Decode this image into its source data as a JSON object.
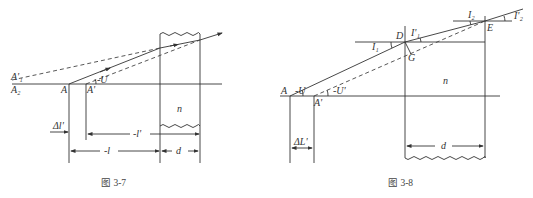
{
  "figures": [
    {
      "id": "fig-3-7",
      "caption": "图 3-7",
      "labels": {
        "A1_prime": "A'₁",
        "A2": "A₂",
        "A": "A",
        "A_prime": "A'",
        "angle_U": "-U",
        "n": "n",
        "delta_l_prime": "Δl'",
        "neg_l_prime": "-l'",
        "neg_l": "-l",
        "d": "d"
      }
    },
    {
      "id": "fig-3-8",
      "caption": "图 3-8",
      "labels": {
        "A": "A",
        "A_prime": "A'",
        "angle_neg_U": "-U",
        "angle_neg_U_prime": "-U'",
        "D": "D",
        "G": "G",
        "E": "E",
        "I1": "I₁",
        "I1_prime": "I'₁",
        "I2": "I₂",
        "I2_prime": "I'₂",
        "n": "n",
        "delta_L_prime": "ΔL'",
        "d": "d"
      }
    }
  ],
  "colors": {
    "stroke": "#333333",
    "background": "#ffffff"
  }
}
